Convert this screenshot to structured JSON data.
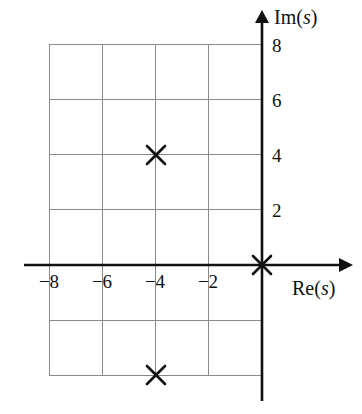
{
  "chart_data": {
    "type": "scatter",
    "title": "",
    "subtitle": "",
    "xlabel": "Re(s)",
    "ylabel": "Im(s)",
    "xlabel_prefix": "Re(",
    "xlabel_var": "s",
    "xlabel_suffix": ")",
    "ylabel_prefix": "Im(",
    "ylabel_var": "s",
    "ylabel_suffix": ")",
    "xlim": [
      -9.5,
      1.8
    ],
    "ylim": [
      -5.2,
      9.0
    ],
    "grid": true,
    "grid_color": "#8a8a8a",
    "axis_color": "#111111",
    "marker_color": "#111111",
    "marker_symbol": "x",
    "legend": "none",
    "xticks": [
      -8,
      -6,
      -4,
      -2
    ],
    "xtick_labels": [
      "−8",
      "−6",
      "−4",
      "−2"
    ],
    "yticks": [
      8,
      6,
      4,
      2
    ],
    "ytick_labels": [
      "8",
      "6",
      "4",
      "2"
    ],
    "grid_x_values": [
      -8,
      -6,
      -4,
      -2,
      0
    ],
    "grid_y_values": [
      8,
      6,
      4,
      2,
      0,
      -2,
      -4
    ],
    "series": [
      {
        "name": "poles",
        "marker": "x",
        "points": [
          {
            "x": -4,
            "y": 4,
            "label": "pole at -4 + 4j"
          },
          {
            "x": 0,
            "y": 0,
            "label": "pole at origin"
          },
          {
            "x": -4,
            "y": -4,
            "label": "pole at -4 - 4j"
          }
        ]
      }
    ]
  },
  "figure": {
    "name": "s-plane-pole-plot"
  }
}
